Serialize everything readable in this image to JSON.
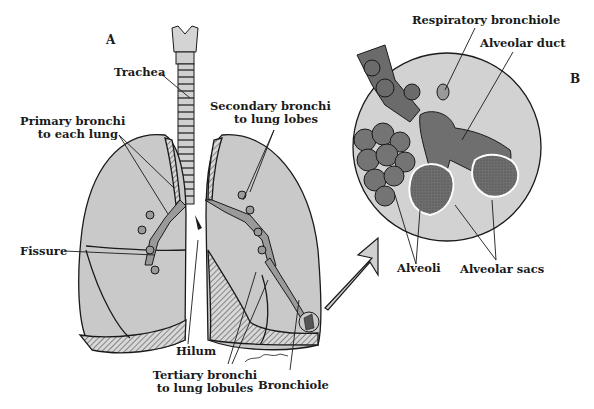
{
  "figure": {
    "panels": {
      "a": "A",
      "b": "B"
    },
    "colors": {
      "lung_fill": "#c9c9c9",
      "tissue_dark": "#6b6b6b",
      "alveoli_fill": "#7a7a7a",
      "circle_fill": "#d2d2d2",
      "stroke": "#1a1a1a"
    },
    "panel_a_labels": {
      "trachea": "Trachea",
      "primary_bronchi": [
        "Primary bronchi",
        "to each lung"
      ],
      "secondary_bronchi": [
        "Secondary bronchi",
        "to lung lobes"
      ],
      "fissure": "Fissure",
      "hilum": "Hilum",
      "tertiary_bronchi": [
        "Tertiary bronchi",
        "to lung lobules"
      ],
      "bronchiole": "Bronchiole"
    },
    "panel_b_labels": {
      "respiratory_bronchiole": "Respiratory bronchiole",
      "alveolar_duct": "Alveolar duct",
      "alveoli": "Alveoli",
      "alveolar_sacs": "Alveolar sacs"
    },
    "signature": "J Fults"
  }
}
